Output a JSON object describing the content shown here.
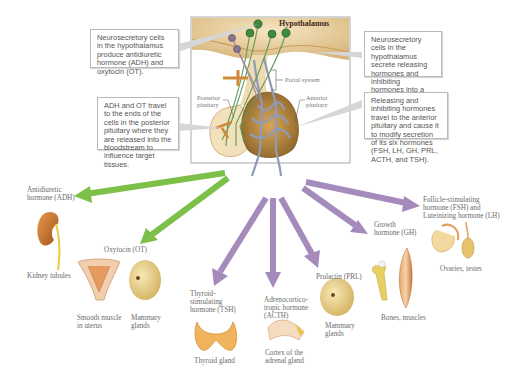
{
  "figure": {
    "title": "Hypothalamus",
    "inset_labels": {
      "portal_system": "Portal system",
      "posterior_pituitary": "Posterior pituitary",
      "anterior_pituitary": "Anterior pituitary"
    }
  },
  "callouts": [
    {
      "id": "neuro-adh-ot",
      "text": "Neurosecretory cells in the hypothalamus produce antidiuretic hormone (ADH) and oxytocin (OT)."
    },
    {
      "id": "adh-ot-travel",
      "text": "ADH and OT travel to the ends of the cells in the posterior pituitary where they are released into the bloodstream to influence target tissues."
    },
    {
      "id": "neuro-releasing",
      "text": "Neurosecretory cells in the hypothalamus secrete releasing hormones and inhibiting hormones into a portal system."
    },
    {
      "id": "releasing-travel",
      "text": "Releasing and inhibiting hormones travel to the anterior pituitary and cause it to modify secretion of its six hormones (FSH, LH, GH, PRL, ACTH, and TSH)."
    }
  ],
  "hormones": [
    {
      "id": "adh",
      "name_lines": [
        "Antidiuretic",
        "hormone (ADH)"
      ],
      "targets": [
        "Kidney tubules"
      ],
      "source": "posterior",
      "arrow_color": "#7cc04a"
    },
    {
      "id": "ot",
      "name_lines": [
        "Oxytocin (OT)"
      ],
      "targets": [
        "Smooth muscle in uterus",
        "Mammary glands"
      ],
      "source": "posterior",
      "arrow_color": "#7cc04a"
    },
    {
      "id": "tsh",
      "name_lines": [
        "Thyroid-",
        "stimulating",
        "hormone (TSH)"
      ],
      "targets": [
        "Thyroid gland"
      ],
      "source": "anterior",
      "arrow_color": "#a48bbb"
    },
    {
      "id": "acth",
      "name_lines": [
        "Adrenocortico-",
        "tropic hormone",
        "(ACTH)"
      ],
      "targets": [
        "Cortex of the adrenal gland"
      ],
      "source": "anterior",
      "arrow_color": "#a48bbb"
    },
    {
      "id": "prl",
      "name_lines": [
        "Prolactin (PRL)"
      ],
      "targets": [
        "Mammary glands"
      ],
      "source": "anterior",
      "arrow_color": "#a48bbb"
    },
    {
      "id": "gh",
      "name_lines": [
        "Growth",
        "hormone (GH)"
      ],
      "targets": [
        "Bones, muscles"
      ],
      "source": "anterior",
      "arrow_color": "#a48bbb"
    },
    {
      "id": "fsh-lh",
      "name_lines": [
        "Follicle-stimulating",
        "hormone (FSH) and",
        "Luteinizing hormone (LH)"
      ],
      "targets": [
        "Ovaries, testes"
      ],
      "source": "anterior",
      "arrow_color": "#a48bbb"
    }
  ],
  "target_labels": {
    "kidney": "Kidney tubules",
    "uterus_l1": "Smooth muscle",
    "uterus_l2": "in uterus",
    "mammary_ot_l1": "Mammary",
    "mammary_ot_l2": "glands",
    "thyroid": "Thyroid gland",
    "adrenal_l1": "Cortex of the",
    "adrenal_l2": "adrenal gland",
    "mammary_prl_l1": "Mammary",
    "mammary_prl_l2": "glands",
    "bones": "Bones, muscles",
    "gonads": "Ovaries, testes"
  },
  "colors": {
    "posterior_arrow": "#7cc04a",
    "anterior_arrow": "#a48bbb",
    "tissue": "#e9d3a6",
    "tissue_dark": "#c89a52",
    "vessel": "#8f9bb8",
    "neuron": "#3f8a3c"
  }
}
